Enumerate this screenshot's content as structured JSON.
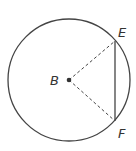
{
  "diagram": {
    "type": "circle-geometry",
    "center": {
      "label": "B",
      "x": 69,
      "y": 80
    },
    "radius": 61,
    "points": [
      {
        "label": "E",
        "x": 115,
        "y": 41
      },
      {
        "label": "F",
        "x": 115,
        "y": 121
      }
    ],
    "segments": [
      {
        "from": "B",
        "to": "E",
        "style": "dashed"
      },
      {
        "from": "B",
        "to": "F",
        "style": "dashed"
      },
      {
        "from": "E",
        "to": "F",
        "style": "solid"
      }
    ],
    "colors": {
      "stroke": "#444444",
      "label": "#333333"
    }
  },
  "labels": {
    "center": "B",
    "e": "E",
    "f": "F"
  }
}
